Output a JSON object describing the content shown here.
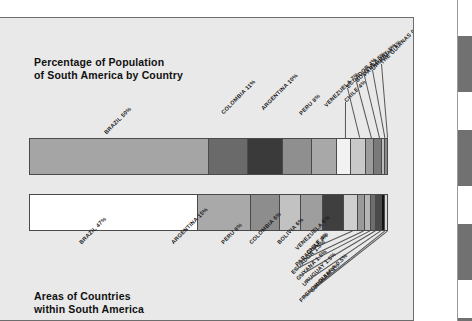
{
  "page": {
    "background_color": "#e9e9e9",
    "border_color": "#6d6d6d",
    "clipped_margin_glyph": "l"
  },
  "titles": {
    "top_line1": "Percentage of Population",
    "top_line2": "of South America by Country",
    "bottom_line1": "Areas of Countries",
    "bottom_line2": "within South America"
  },
  "chart_data": [
    {
      "type": "bar",
      "orientation": "horizontal-stacked",
      "title": "Percentage of Population of South America by Country",
      "xlabel": "",
      "ylabel": "",
      "categories": [
        "BRAZIL",
        "COLOMBIA",
        "ARGENTINA",
        "PERU",
        "VENEZUELA",
        "CHILE",
        "ECUADOR",
        "BOLIVIA",
        "PARAGUAY",
        "URUGUAY",
        "THE GUIANAS"
      ],
      "values": [
        50,
        11,
        10,
        8,
        7,
        4,
        4,
        2.5,
        2,
        1,
        0.5
      ],
      "labels": [
        "BRAZIL 50%",
        "COLOMBIA 11%",
        "ARGENTINA 10%",
        "PERU 8%",
        "VENEZUELA 7%",
        "CHILE 4%",
        "ECUADOR 4%",
        "BOLIVIA 2.5%",
        "PARAGUAY 2%",
        "URUGUAY 1%",
        "THE GUIANAS 0.5%"
      ],
      "colors": [
        "#a5a5a5",
        "#6a6a6a",
        "#3a3a3a",
        "#8f8f8f",
        "#a8a8a8",
        "#f2f2f2",
        "#c9c9c9",
        "#9c9c9c",
        "#7a7a7a",
        "#bdbdbd",
        "#8a8a8a"
      ],
      "total": 100,
      "units": "percent"
    },
    {
      "type": "bar",
      "orientation": "horizontal-stacked",
      "title": "Areas of Countries within South America",
      "xlabel": "",
      "ylabel": "",
      "categories": [
        "BRAZIL",
        "ARGENTINA",
        "PERU",
        "COLOMBIA",
        "BOLIVIA",
        "VENEZUELA",
        "CHILE",
        "PARAGUAY",
        "ECUADOR",
        "GUYANA",
        "URUGUAY",
        "SURINAM",
        "FRENCH GUIANA"
      ],
      "values": [
        47,
        15,
        8,
        6,
        6,
        6,
        4,
        2,
        1.5,
        1.5,
        1.5,
        1,
        0.5
      ],
      "labels": [
        "BRAZIL 47%",
        "ARGENTINA 15%",
        "PERU 8%",
        "COLOMBIA 6%",
        "BOLIVIA 6%",
        "VENEZUELA 6%",
        "CHILE 4%",
        "PARAGUAY 2%",
        "ECUADOR 1.5%",
        "GUYANA 1.5%",
        "URUGUAY 1.5%",
        "SURINAM 1%",
        "FRENCH GUIANA 0.5%"
      ],
      "colors": [
        "#ffffff",
        "#a9a9a9",
        "#8d8d8d",
        "#c2c2c2",
        "#9e9e9e",
        "#3f3f3f",
        "#cfcfcf",
        "#9a9a9a",
        "#b5b5b5",
        "#6e6e6e",
        "#4a4a4a",
        "#141414",
        "#d8d8d8"
      ],
      "total": 100,
      "units": "percent"
    }
  ],
  "edge_strip": {
    "tabs": [
      {
        "top": 36,
        "height": 56
      },
      {
        "top": 130,
        "height": 56
      },
      {
        "top": 224,
        "height": 56
      },
      {
        "top": 318,
        "height": 3
      }
    ]
  }
}
